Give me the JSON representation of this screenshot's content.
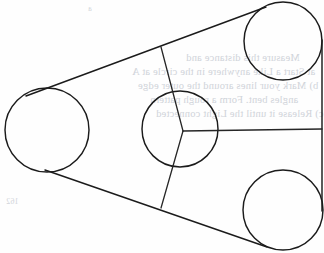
{
  "figure": {
    "background_color": "#fefefe",
    "stroke_color": "#1b1b1b",
    "bleed_text_color": "#c9cdd4",
    "width": 324,
    "height": 253
  },
  "circles": [
    {
      "name": "left-pulley",
      "label": "Left pulley",
      "cx": 47,
      "cy": 130,
      "r": 42
    },
    {
      "name": "top-right-pulley",
      "label": "Top right pulley",
      "cx": 283,
      "cy": 41,
      "r": 39
    },
    {
      "name": "bottom-right-pulley",
      "label": "Bottom right pulley",
      "cx": 283,
      "cy": 210,
      "r": 40
    },
    {
      "name": "center-hub-circle",
      "label": "Center hub circle",
      "cx": 180,
      "cy": 129,
      "r": 38
    }
  ],
  "hub": {
    "name": "spoke-junction",
    "label": "Spoke junction point",
    "x": 183,
    "y": 131
  },
  "spokes": [
    {
      "name": "spoke-upper",
      "label": "Upper spoke",
      "x1": 183,
      "y1": 131,
      "x2": 161,
      "y2": 47
    },
    {
      "name": "spoke-lower",
      "label": "Lower spoke",
      "x1": 183,
      "y1": 131,
      "x2": 161,
      "y2": 208
    },
    {
      "name": "spoke-right",
      "label": "Right spoke",
      "x1": 183,
      "y1": 131,
      "x2": 322,
      "y2": 129
    }
  ],
  "tangent_lines": [
    {
      "name": "tangent-upper-left",
      "label": "Upper left tangent belt segment",
      "x1": 26,
      "y1": 96,
      "x2": 266,
      "y2": 7
    },
    {
      "name": "tangent-lower-left",
      "label": "Lower left tangent belt segment",
      "x1": 45,
      "y1": 170,
      "x2": 267,
      "y2": 247
    },
    {
      "name": "tangent-right-vertical",
      "label": "Right vertical tangent belt segment",
      "x1": 322,
      "y1": 40,
      "x2": 322,
      "y2": 211
    }
  ],
  "bleed_text": {
    "note": "Faint mirrored show-through text from reverse of page",
    "lines": [
      {
        "text": "Measure this distance and",
        "x": 186,
        "y": 58,
        "size": 10.5
      },
      {
        "text": "at  Start a Like  anywhere in the  circle at  A",
        "x": 132,
        "y": 72,
        "size": 10.5
      },
      {
        "text": "b)  Mark your lines around the  outer edge",
        "x": 138,
        "y": 86,
        "size": 10.5
      },
      {
        "text": "angles  bent.  Form  a  rough  pattern",
        "x": 150,
        "y": 100,
        "size": 10.5
      },
      {
        "text": "c)  Release  it  until  the  Light  connected",
        "x": 156,
        "y": 114,
        "size": 10.5
      },
      {
        "text": "a",
        "x": 88,
        "y": 9,
        "size": 8
      },
      {
        "text": "162",
        "x": 6,
        "y": 202,
        "size": 8
      }
    ]
  }
}
